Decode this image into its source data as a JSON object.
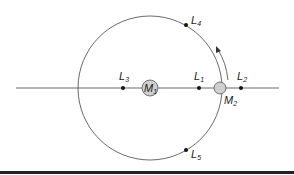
{
  "diagram": {
    "bodies": [
      {
        "id": "M1",
        "label": "M",
        "sub": "1",
        "cx": 150,
        "cy": 88,
        "r": 8,
        "fill": "#cfcfcf"
      },
      {
        "id": "M2",
        "label": "M",
        "sub": "2",
        "cx": 220,
        "cy": 88,
        "r": 6,
        "fill": "#cfcfcf"
      }
    ],
    "points": [
      {
        "id": "L1",
        "label": "L",
        "sub": "1",
        "x": 199,
        "y": 88
      },
      {
        "id": "L2",
        "label": "L",
        "sub": "2",
        "x": 241,
        "y": 88
      },
      {
        "id": "L3",
        "label": "L",
        "sub": "3",
        "x": 123,
        "y": 88
      },
      {
        "id": "L4",
        "label": "L",
        "sub": "4",
        "x": 186,
        "y": 25
      },
      {
        "id": "L5",
        "label": "L",
        "sub": "5",
        "x": 186,
        "y": 150
      }
    ],
    "orbit": {
      "cx": 150,
      "cy": 88,
      "r": 72
    },
    "axis_line": {
      "x1": 16,
      "x2": 279,
      "y": 88
    },
    "rotation_arrow": "counter-clockwise",
    "colors": {
      "line": "#333333",
      "body_fill": "#cfcfcf",
      "rule": "#222222"
    }
  }
}
